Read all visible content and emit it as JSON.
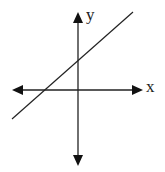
{
  "diagram": {
    "type": "coordinate-plane-with-line",
    "x_axis_label": "x",
    "y_axis_label": "y",
    "line": {
      "description": "line with positive slope, positive y-intercept, negative x-intercept"
    },
    "colors": {
      "stroke": "#222222",
      "background": "#ffffff"
    }
  }
}
